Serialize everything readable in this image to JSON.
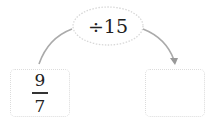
{
  "diagram": {
    "operation": {
      "label": "÷15"
    },
    "input": {
      "numerator": "9",
      "denominator": "7"
    },
    "output": {
      "value": ""
    },
    "colors": {
      "arrow": "#aaaaaa",
      "border": "#dcdcdc",
      "text": "#222222"
    }
  }
}
